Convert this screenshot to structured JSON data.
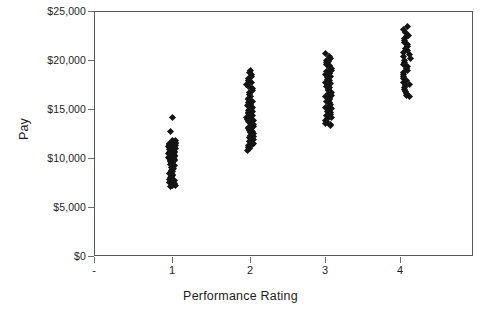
{
  "chart_data": {
    "type": "scatter",
    "title": "",
    "xlabel": "Performance Rating",
    "ylabel": "Pay",
    "xlim": [
      0,
      4.85
    ],
    "ylim": [
      0,
      25000
    ],
    "grid": false,
    "legend": "none",
    "marker": "diamond",
    "marker_color": "#141414",
    "frame_color": "#55595c",
    "background": "#ffffff",
    "x_tick_labels": [
      "-",
      "1",
      "2",
      "3",
      "4"
    ],
    "x_tick_values": [
      0,
      1,
      2,
      3,
      4
    ],
    "y_tick_labels": [
      "$0",
      "$5,000",
      "$10,000",
      "$15,000",
      "$20,000",
      "$25,000"
    ],
    "y_tick_values": [
      0,
      5000,
      10000,
      15000,
      20000,
      25000
    ],
    "series": [
      {
        "name": "Pay by Performance Rating",
        "points": [
          {
            "x": 1,
            "y": 14100
          },
          {
            "x": 1,
            "y": 12700
          },
          {
            "x": 1,
            "y": 11800
          },
          {
            "x": 1,
            "y": 11750
          },
          {
            "x": 1,
            "y": 11700
          },
          {
            "x": 1,
            "y": 11650
          },
          {
            "x": 1,
            "y": 11600
          },
          {
            "x": 1,
            "y": 11550
          },
          {
            "x": 1,
            "y": 11500
          },
          {
            "x": 1,
            "y": 11450
          },
          {
            "x": 1,
            "y": 11400
          },
          {
            "x": 1,
            "y": 11350
          },
          {
            "x": 1,
            "y": 11300
          },
          {
            "x": 1,
            "y": 11250
          },
          {
            "x": 1,
            "y": 11200
          },
          {
            "x": 1,
            "y": 11150
          },
          {
            "x": 1,
            "y": 11100
          },
          {
            "x": 1,
            "y": 11050
          },
          {
            "x": 1,
            "y": 11000
          },
          {
            "x": 1,
            "y": 10950
          },
          {
            "x": 1,
            "y": 10900
          },
          {
            "x": 1,
            "y": 10850
          },
          {
            "x": 1,
            "y": 10800
          },
          {
            "x": 1,
            "y": 10750
          },
          {
            "x": 1,
            "y": 10700
          },
          {
            "x": 1,
            "y": 10650
          },
          {
            "x": 1,
            "y": 10600
          },
          {
            "x": 1,
            "y": 10550
          },
          {
            "x": 1,
            "y": 10500
          },
          {
            "x": 1,
            "y": 10450
          },
          {
            "x": 1,
            "y": 10400
          },
          {
            "x": 1,
            "y": 10350
          },
          {
            "x": 1,
            "y": 10300
          },
          {
            "x": 1,
            "y": 10250
          },
          {
            "x": 1,
            "y": 10200
          },
          {
            "x": 1,
            "y": 10150
          },
          {
            "x": 1,
            "y": 10100
          },
          {
            "x": 1,
            "y": 10050
          },
          {
            "x": 1,
            "y": 10000
          },
          {
            "x": 1,
            "y": 9950
          },
          {
            "x": 1,
            "y": 9900
          },
          {
            "x": 1,
            "y": 9850
          },
          {
            "x": 1,
            "y": 9800
          },
          {
            "x": 1,
            "y": 9750
          },
          {
            "x": 1,
            "y": 9700
          },
          {
            "x": 1,
            "y": 9650
          },
          {
            "x": 1,
            "y": 9600
          },
          {
            "x": 1,
            "y": 9550
          },
          {
            "x": 1,
            "y": 9500
          },
          {
            "x": 1,
            "y": 9400
          },
          {
            "x": 1,
            "y": 9300
          },
          {
            "x": 1,
            "y": 9200
          },
          {
            "x": 1,
            "y": 9100
          },
          {
            "x": 1,
            "y": 9000
          },
          {
            "x": 1,
            "y": 8900
          },
          {
            "x": 1,
            "y": 8800
          },
          {
            "x": 1,
            "y": 8700
          },
          {
            "x": 1,
            "y": 8600
          },
          {
            "x": 1,
            "y": 8500
          },
          {
            "x": 1,
            "y": 8400
          },
          {
            "x": 1,
            "y": 8300
          },
          {
            "x": 1,
            "y": 8200
          },
          {
            "x": 1,
            "y": 8100
          },
          {
            "x": 1,
            "y": 8000
          },
          {
            "x": 1,
            "y": 7900
          },
          {
            "x": 1,
            "y": 7800
          },
          {
            "x": 1,
            "y": 7700
          },
          {
            "x": 1,
            "y": 7600
          },
          {
            "x": 1,
            "y": 7500
          },
          {
            "x": 1,
            "y": 7400
          },
          {
            "x": 1,
            "y": 7300
          },
          {
            "x": 1,
            "y": 7200
          },
          {
            "x": 1,
            "y": 7150
          },
          {
            "x": 1,
            "y": 7100
          },
          {
            "x": 2,
            "y": 18900
          },
          {
            "x": 2,
            "y": 18700
          },
          {
            "x": 2,
            "y": 18500
          },
          {
            "x": 2,
            "y": 18300
          },
          {
            "x": 2,
            "y": 18100
          },
          {
            "x": 2,
            "y": 17900
          },
          {
            "x": 2,
            "y": 17700
          },
          {
            "x": 2,
            "y": 17500
          },
          {
            "x": 2,
            "y": 17300
          },
          {
            "x": 2,
            "y": 17100
          },
          {
            "x": 2,
            "y": 16900
          },
          {
            "x": 2,
            "y": 16700
          },
          {
            "x": 2,
            "y": 16500
          },
          {
            "x": 2,
            "y": 16300
          },
          {
            "x": 2,
            "y": 16100
          },
          {
            "x": 2,
            "y": 15950
          },
          {
            "x": 2,
            "y": 15800
          },
          {
            "x": 2,
            "y": 15650
          },
          {
            "x": 2,
            "y": 15500
          },
          {
            "x": 2,
            "y": 15350
          },
          {
            "x": 2,
            "y": 15200
          },
          {
            "x": 2,
            "y": 15050
          },
          {
            "x": 2,
            "y": 14900
          },
          {
            "x": 2,
            "y": 14800
          },
          {
            "x": 2,
            "y": 14700
          },
          {
            "x": 2,
            "y": 14600
          },
          {
            "x": 2,
            "y": 14500
          },
          {
            "x": 2,
            "y": 14400
          },
          {
            "x": 2,
            "y": 14300
          },
          {
            "x": 2,
            "y": 14200
          },
          {
            "x": 2,
            "y": 14100
          },
          {
            "x": 2,
            "y": 14000
          },
          {
            "x": 2,
            "y": 13900
          },
          {
            "x": 2,
            "y": 13800
          },
          {
            "x": 2,
            "y": 13700
          },
          {
            "x": 2,
            "y": 13600
          },
          {
            "x": 2,
            "y": 13500
          },
          {
            "x": 2,
            "y": 13400
          },
          {
            "x": 2,
            "y": 13300
          },
          {
            "x": 2,
            "y": 13200
          },
          {
            "x": 2,
            "y": 13100
          },
          {
            "x": 2,
            "y": 13000
          },
          {
            "x": 2,
            "y": 12900
          },
          {
            "x": 2,
            "y": 12800
          },
          {
            "x": 2,
            "y": 12700
          },
          {
            "x": 2,
            "y": 12600
          },
          {
            "x": 2,
            "y": 12500
          },
          {
            "x": 2,
            "y": 12400
          },
          {
            "x": 2,
            "y": 12300
          },
          {
            "x": 2,
            "y": 12200
          },
          {
            "x": 2,
            "y": 12100
          },
          {
            "x": 2,
            "y": 12000
          },
          {
            "x": 2,
            "y": 11900
          },
          {
            "x": 2,
            "y": 11800
          },
          {
            "x": 2,
            "y": 11700
          },
          {
            "x": 2,
            "y": 11600
          },
          {
            "x": 2,
            "y": 11500
          },
          {
            "x": 2,
            "y": 11400
          },
          {
            "x": 2,
            "y": 11250
          },
          {
            "x": 2,
            "y": 11100
          },
          {
            "x": 2,
            "y": 10950
          },
          {
            "x": 2,
            "y": 10800
          },
          {
            "x": 3,
            "y": 20700
          },
          {
            "x": 3,
            "y": 20400
          },
          {
            "x": 3,
            "y": 20200
          },
          {
            "x": 3,
            "y": 20000
          },
          {
            "x": 3,
            "y": 19850
          },
          {
            "x": 3,
            "y": 19700
          },
          {
            "x": 3,
            "y": 19550
          },
          {
            "x": 3,
            "y": 19400
          },
          {
            "x": 3,
            "y": 19250
          },
          {
            "x": 3,
            "y": 19100
          },
          {
            "x": 3,
            "y": 18950
          },
          {
            "x": 3,
            "y": 18800
          },
          {
            "x": 3,
            "y": 18650
          },
          {
            "x": 3,
            "y": 18500
          },
          {
            "x": 3,
            "y": 18350
          },
          {
            "x": 3,
            "y": 18200
          },
          {
            "x": 3,
            "y": 18050
          },
          {
            "x": 3,
            "y": 17900
          },
          {
            "x": 3,
            "y": 17750
          },
          {
            "x": 3,
            "y": 17600
          },
          {
            "x": 3,
            "y": 17450
          },
          {
            "x": 3,
            "y": 17300
          },
          {
            "x": 3,
            "y": 17150
          },
          {
            "x": 3,
            "y": 17000
          },
          {
            "x": 3,
            "y": 16850
          },
          {
            "x": 3,
            "y": 16700
          },
          {
            "x": 3,
            "y": 16550
          },
          {
            "x": 3,
            "y": 16400
          },
          {
            "x": 3,
            "y": 16250
          },
          {
            "x": 3,
            "y": 16100
          },
          {
            "x": 3,
            "y": 15950
          },
          {
            "x": 3,
            "y": 15800
          },
          {
            "x": 3,
            "y": 15650
          },
          {
            "x": 3,
            "y": 15500
          },
          {
            "x": 3,
            "y": 15350
          },
          {
            "x": 3,
            "y": 15200
          },
          {
            "x": 3,
            "y": 15050
          },
          {
            "x": 3,
            "y": 14900
          },
          {
            "x": 3,
            "y": 14750
          },
          {
            "x": 3,
            "y": 14600
          },
          {
            "x": 3,
            "y": 14450
          },
          {
            "x": 3,
            "y": 14300
          },
          {
            "x": 3,
            "y": 14150
          },
          {
            "x": 3,
            "y": 14000
          },
          {
            "x": 3,
            "y": 13850
          },
          {
            "x": 3,
            "y": 13700
          },
          {
            "x": 3,
            "y": 13550
          },
          {
            "x": 3,
            "y": 13400
          },
          {
            "x": 3,
            "y": 13300
          },
          {
            "x": 4,
            "y": 23400
          },
          {
            "x": 4,
            "y": 23100
          },
          {
            "x": 4,
            "y": 22800
          },
          {
            "x": 4,
            "y": 22550
          },
          {
            "x": 4,
            "y": 22350
          },
          {
            "x": 4,
            "y": 22150
          },
          {
            "x": 4,
            "y": 21950
          },
          {
            "x": 4,
            "y": 21750
          },
          {
            "x": 4,
            "y": 21550
          },
          {
            "x": 4,
            "y": 21350
          },
          {
            "x": 4,
            "y": 21150
          },
          {
            "x": 4,
            "y": 20950
          },
          {
            "x": 4,
            "y": 20750
          },
          {
            "x": 4,
            "y": 20550
          },
          {
            "x": 4,
            "y": 20350
          },
          {
            "x": 4,
            "y": 20150
          },
          {
            "x": 4,
            "y": 19950
          },
          {
            "x": 4,
            "y": 19750
          },
          {
            "x": 4,
            "y": 19550
          },
          {
            "x": 4,
            "y": 19350
          },
          {
            "x": 4,
            "y": 19150
          },
          {
            "x": 4,
            "y": 18950
          },
          {
            "x": 4,
            "y": 18750
          },
          {
            "x": 4,
            "y": 18550
          },
          {
            "x": 4,
            "y": 18350
          },
          {
            "x": 4,
            "y": 18150
          },
          {
            "x": 4,
            "y": 17950
          },
          {
            "x": 4,
            "y": 17750
          },
          {
            "x": 4,
            "y": 17550
          },
          {
            "x": 4,
            "y": 17350
          },
          {
            "x": 4,
            "y": 17150
          },
          {
            "x": 4,
            "y": 16950
          },
          {
            "x": 4,
            "y": 16750
          },
          {
            "x": 4,
            "y": 16550
          },
          {
            "x": 4,
            "y": 16400
          },
          {
            "x": 4,
            "y": 16300
          }
        ]
      }
    ]
  }
}
